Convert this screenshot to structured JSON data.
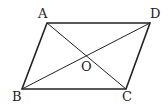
{
  "diagram": {
    "type": "parallelogram-with-diagonals",
    "stroke_color": "#222222",
    "vertices": {
      "A": {
        "x": 47,
        "y": 23
      },
      "D": {
        "x": 150,
        "y": 23
      },
      "B": {
        "x": 22,
        "y": 89
      },
      "C": {
        "x": 126,
        "y": 89
      }
    },
    "intersection": {
      "O": {
        "x": 86,
        "y": 56
      }
    },
    "labels": {
      "A": "A",
      "B": "B",
      "C": "C",
      "D": "D",
      "O": "O"
    },
    "edges": [
      "AD",
      "DC",
      "CB",
      "BA"
    ],
    "diagonals": [
      "AC",
      "BD"
    ]
  }
}
